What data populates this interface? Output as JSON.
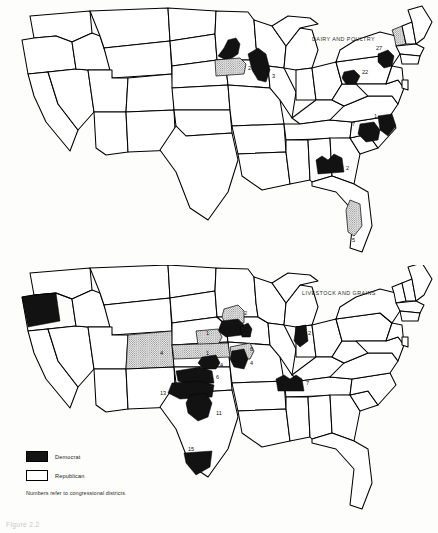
{
  "figure": {
    "caption": "Figure 2.2"
  },
  "maps": [
    {
      "id": "dairy-and-poultry",
      "title": "DAIRY AND POULTRY",
      "districts": [
        {
          "label": "6",
          "state": "Minnesota",
          "party": "Democrat"
        },
        {
          "label": "2",
          "state": "Minnesota",
          "party": "Republican"
        },
        {
          "label": "3",
          "state": "Wisconsin",
          "party": "Democrat"
        },
        {
          "label": "27",
          "state": "New York",
          "party": "Democrat"
        },
        {
          "label": "22",
          "state": "Pennsylvania",
          "party": "Democrat"
        },
        {
          "label": "1",
          "state": "North Carolina",
          "party": "Democrat"
        },
        {
          "label": "7",
          "state": "North Carolina",
          "party": "Democrat"
        },
        {
          "label": "2",
          "state": "Georgia",
          "party": "Democrat"
        },
        {
          "label": "5",
          "state": "Florida",
          "party": "Republican"
        }
      ]
    },
    {
      "id": "livestock-and-grains",
      "title": "LIVESTOCK AND GRAINS",
      "districts": [
        {
          "label": "4",
          "state": "Oregon",
          "party": "Democrat"
        },
        {
          "label": "2",
          "state": "Minnesota",
          "party": "Republican"
        },
        {
          "label": "6",
          "state": "Iowa",
          "party": "Democrat"
        },
        {
          "label": "5",
          "state": "Iowa",
          "party": "Democrat"
        },
        {
          "label": "1",
          "state": "Nebraska",
          "party": "Republican"
        },
        {
          "label": "1",
          "state": "Nebraska",
          "party": "Republican"
        },
        {
          "label": "6",
          "state": "Illinois",
          "party": "Republican"
        },
        {
          "label": "4",
          "state": "Colorado",
          "party": "Republican"
        },
        {
          "label": "4",
          "state": "Kansas",
          "party": "Democrat"
        },
        {
          "label": "4",
          "state": "Illinois",
          "party": "Democrat"
        },
        {
          "label": "2",
          "state": "Indiana",
          "party": "Democrat"
        },
        {
          "label": "6",
          "state": "Oklahoma",
          "party": "Democrat"
        },
        {
          "label": "13",
          "state": "Oklahoma",
          "party": "Democrat"
        },
        {
          "label": "11",
          "state": "Oklahoma",
          "party": "Democrat"
        },
        {
          "label": "15",
          "state": "Texas",
          "party": "Democrat"
        },
        {
          "label": "7",
          "state": "Tennessee",
          "party": "Democrat"
        }
      ]
    }
  ],
  "legend": {
    "items": [
      {
        "label": "Democrat",
        "pattern": "solid-black",
        "color": "#141414"
      },
      {
        "label": "Republican",
        "pattern": "dotted-gray",
        "color": "#4a4a4a"
      }
    ],
    "note": "Numbers refer to congressional districts."
  }
}
